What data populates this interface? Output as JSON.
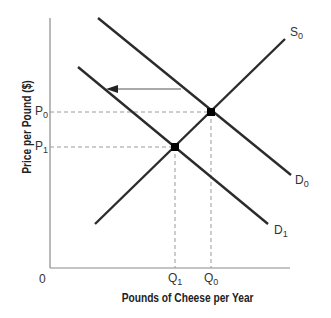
{
  "diagram": {
    "type": "supply-demand",
    "x_axis": {
      "title": "Pounds of Cheese per Year",
      "origin_label": "0"
    },
    "y_axis": {
      "title": "Price per Pound ($)"
    },
    "price_labels": [
      {
        "base": "P",
        "sub": "0"
      },
      {
        "base": "P",
        "sub": "1"
      }
    ],
    "quantity_labels": [
      {
        "base": "Q",
        "sub": "1"
      },
      {
        "base": "Q",
        "sub": "0"
      }
    ],
    "curves": [
      {
        "name": "S",
        "sub": "0",
        "kind": "supply"
      },
      {
        "name": "D",
        "sub": "0",
        "kind": "demand-original"
      },
      {
        "name": "D",
        "sub": "1",
        "kind": "demand-shifted"
      }
    ],
    "shift": "Demand shifts left from D0 to D1",
    "equilibria": [
      {
        "name": "E0",
        "price": "P0",
        "quantity": "Q0"
      },
      {
        "name": "E1",
        "price": "P1",
        "quantity": "Q1"
      }
    ],
    "colors": {
      "curve": "#2b2b2b",
      "axis": "#888888",
      "guide": "#999999"
    }
  }
}
